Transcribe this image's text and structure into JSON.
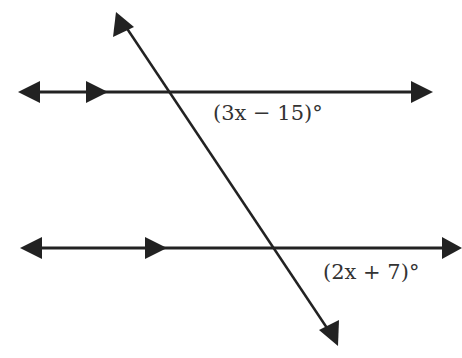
{
  "diagram": {
    "type": "parallel-lines-transversal",
    "angle_labels": {
      "top": "(3x − 15)°",
      "bottom": "(2x + 7)°"
    },
    "colors": {
      "line": "#222222",
      "background": "#ffffff"
    }
  }
}
